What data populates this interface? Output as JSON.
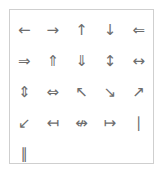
{
  "panel": {
    "border_color": "#cfcfcf",
    "background_color": "#ffffff",
    "glyph_color": "#6d6d6d",
    "columns": 5,
    "rows": 5
  },
  "glyphs": [
    {
      "name": "leftwards-arrow-icon",
      "char": "←"
    },
    {
      "name": "rightwards-arrow-icon",
      "char": "→"
    },
    {
      "name": "upwards-arrow-icon",
      "char": "↑"
    },
    {
      "name": "downwards-arrow-icon",
      "char": "↓"
    },
    {
      "name": "leftwards-double-arrow-icon",
      "char": "⇐"
    },
    {
      "name": "rightwards-double-arrow-icon",
      "char": "⇒"
    },
    {
      "name": "upwards-double-arrow-icon",
      "char": "⇑"
    },
    {
      "name": "downwards-double-arrow-icon",
      "char": "⇓"
    },
    {
      "name": "up-down-arrow-icon",
      "char": "↕"
    },
    {
      "name": "left-right-arrow-icon",
      "char": "↔"
    },
    {
      "name": "up-down-double-arrow-icon",
      "char": "⇕"
    },
    {
      "name": "left-right-double-arrow-icon",
      "char": "⇔"
    },
    {
      "name": "north-west-arrow-icon",
      "char": "↖"
    },
    {
      "name": "south-east-arrow-icon",
      "char": "↘"
    },
    {
      "name": "north-east-arrow-icon",
      "char": "↗"
    },
    {
      "name": "south-west-arrow-icon",
      "char": "↙"
    },
    {
      "name": "leftwards-arrow-from-bar-icon",
      "char": "↤"
    },
    {
      "name": "left-right-arrow-from-bar-icon",
      "char": "↮"
    },
    {
      "name": "rightwards-arrow-from-bar-icon",
      "char": "↦"
    },
    {
      "name": "vertical-bar-icon",
      "char": "∣"
    },
    {
      "name": "double-vertical-bar-icon",
      "char": "∥"
    }
  ]
}
